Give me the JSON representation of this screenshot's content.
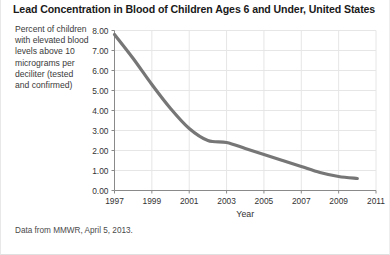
{
  "title": "Lead Concentration in Blood of Children Ages 6 and Under, United States",
  "axis_caption": "Percent of children with elevated blood levels above 10 micrograms per deciliter (tested and confirmed)",
  "footnote": "Data from MMWR, April 5, 2013.",
  "colors": {
    "line": "#767676",
    "grid": "#e6e6e6",
    "axis": "#8a8a8a",
    "text": "#333333",
    "title": "#1a1a1a",
    "background": "#ffffff"
  },
  "chart_data": {
    "type": "line",
    "title": "Lead Concentration in Blood of Children Ages 6 and Under, United States",
    "xlabel": "Year",
    "ylabel": "Percent of children with elevated blood levels above 10 micrograms per deciliter (tested and confirmed)",
    "xlim": [
      1997,
      2011
    ],
    "ylim": [
      0,
      8
    ],
    "xticks": [
      1997,
      1999,
      2001,
      2003,
      2005,
      2007,
      2009,
      2011
    ],
    "yticks": [
      0,
      1,
      2,
      3,
      4,
      5,
      6,
      7,
      8
    ],
    "ytick_labels": [
      "0.00",
      "1.00",
      "2.00",
      "3.00",
      "4.00",
      "5.00",
      "6.00",
      "7.00",
      "8.00"
    ],
    "xtick_labels": [
      "1997",
      "1999",
      "2001",
      "2003",
      "2005",
      "2007",
      "2009",
      "2011"
    ],
    "grid": true,
    "legend": false,
    "x": [
      1997,
      1998,
      1999,
      2000,
      2001,
      2002,
      2003,
      2004,
      2005,
      2006,
      2007,
      2008,
      2009,
      2010
    ],
    "values": [
      7.8,
      6.6,
      5.3,
      4.1,
      3.1,
      2.5,
      2.4,
      2.1,
      1.8,
      1.5,
      1.2,
      0.9,
      0.7,
      0.6
    ],
    "series": [
      {
        "name": "Percent of children with elevated blood lead levels",
        "values": [
          7.8,
          6.6,
          5.3,
          4.1,
          3.1,
          2.5,
          2.4,
          2.1,
          1.8,
          1.5,
          1.2,
          0.9,
          0.7,
          0.6
        ]
      }
    ]
  }
}
